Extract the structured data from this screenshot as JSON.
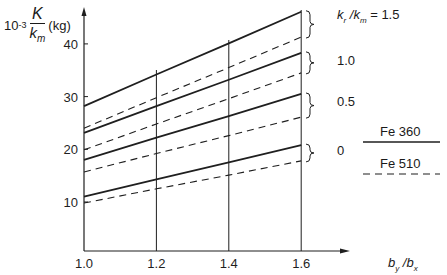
{
  "chart_data": {
    "type": "line",
    "title": "",
    "ylabel_prefix": "10",
    "ylabel_exp": "-3",
    "ylabel_num": "K",
    "ylabel_den": "k",
    "ylabel_den_sub": "m",
    "ylabel_unit": "(kg)",
    "xlabel": "b_y / b_x",
    "xlabel_parts": {
      "b1": "b",
      "s1": "y",
      "slash": " /",
      "b2": "b",
      "s2": "x"
    },
    "x": [
      1.0,
      1.2,
      1.4,
      1.6
    ],
    "x_ticks": [
      "1.0",
      "1.2",
      "1.4",
      "1.6"
    ],
    "y_ticks": [
      "10",
      "20",
      "30",
      "40"
    ],
    "ylim": [
      0.5,
      48
    ],
    "xlim": [
      1.0,
      1.75
    ],
    "grid": "vertical lines at 1.2, 1.4, 1.6",
    "series": [
      {
        "name": "Fe 360, kr/km = 1.5",
        "style": "solid",
        "ratio": "1.5",
        "values": [
          28.2,
          34.2,
          40.1,
          46.1
        ]
      },
      {
        "name": "Fe 510, kr/km = 1.5",
        "style": "dashed",
        "ratio": "1.5",
        "values": [
          24.0,
          29.8,
          35.5,
          41.3
        ]
      },
      {
        "name": "Fe 360, kr/km = 1.0",
        "style": "solid",
        "ratio": "1.0",
        "values": [
          23.1,
          28.2,
          33.2,
          38.3
        ]
      },
      {
        "name": "Fe 510, kr/km = 1.0",
        "style": "dashed",
        "ratio": "1.0",
        "values": [
          19.9,
          24.8,
          29.6,
          34.5
        ]
      },
      {
        "name": "Fe 360, kr/km = 0.5",
        "style": "solid",
        "ratio": "0.5",
        "values": [
          18.0,
          22.2,
          26.3,
          30.5
        ]
      },
      {
        "name": "Fe 510, kr/km = 0.5",
        "style": "dashed",
        "ratio": "0.5",
        "values": [
          15.7,
          19.2,
          22.6,
          26.1
        ]
      },
      {
        "name": "Fe 360, kr/km = 0",
        "style": "solid",
        "ratio": "0",
        "values": [
          11.0,
          14.3,
          17.5,
          20.8
        ]
      },
      {
        "name": "Fe 510, kr/km = 0",
        "style": "dashed",
        "ratio": "0",
        "values": [
          9.8,
          12.5,
          15.1,
          17.8
        ]
      }
    ],
    "group_labels": [
      "k_r / k_m = 1.5",
      "1.0",
      "0.5",
      "0"
    ],
    "legend": [
      {
        "label": "Fe 360",
        "style": "solid"
      },
      {
        "label": "Fe 510",
        "style": "dashed"
      }
    ],
    "legend_position": "right"
  },
  "labels": {
    "group_first_prefix": "k",
    "group_first_sub1": "r",
    "group_first_mid": " /k",
    "group_first_sub2": "m",
    "group_first_suffix": " = 1.5",
    "group_2": "1.0",
    "group_3": "0.5",
    "group_4": "0",
    "legend_1": "Fe 360",
    "legend_2": "Fe 510"
  }
}
